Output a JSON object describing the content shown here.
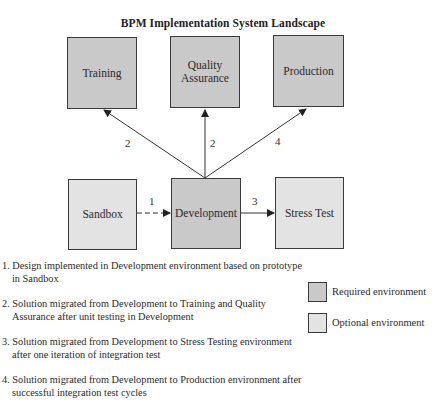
{
  "title": "BPM Implementation System Landscape",
  "colors": {
    "required": "#c9c9c9",
    "optional": "#e3e3e3",
    "border": "#3a3a3a"
  },
  "nodes": {
    "training": {
      "label": "Training",
      "type": "required"
    },
    "quality_assurance": {
      "label": "Quality Assurance",
      "line1": "Quality",
      "line2": "Assurance",
      "type": "required"
    },
    "production": {
      "label": "Production",
      "type": "required"
    },
    "sandbox": {
      "label": "Sandbox",
      "type": "optional"
    },
    "development": {
      "label": "Development",
      "type": "required"
    },
    "stress_test": {
      "label": "Stress Test",
      "type": "optional"
    }
  },
  "edges": [
    {
      "from": "Sandbox",
      "to": "Development",
      "label": "1",
      "style": "dashed"
    },
    {
      "from": "Development",
      "to": "Training",
      "label": "2",
      "style": "solid"
    },
    {
      "from": "Development",
      "to": "Quality Assurance",
      "label": "2",
      "style": "solid"
    },
    {
      "from": "Development",
      "to": "Stress Test",
      "label": "3",
      "style": "solid"
    },
    {
      "from": "Development",
      "to": "Production",
      "label": "4",
      "style": "solid"
    }
  ],
  "notes": [
    "1. Design implemented in Development environment based on prototype in Sandbox",
    "2. Solution migrated from Development to Training and Quality Assurance after unit testing in Development",
    "3. Solution migrated from Development to Stress Testing environment after one iteration of integration test",
    "4. Solution migrated from Development to Production environment after successful integration test cycles"
  ],
  "legend": {
    "required": "Required environment",
    "optional": "Optional environment"
  }
}
